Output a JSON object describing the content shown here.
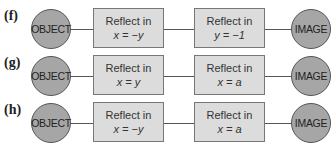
{
  "rows": [
    {
      "label": "(f)",
      "start": "OBJECT",
      "steps": [
        {
          "title": "Reflect in",
          "eq": "x = −y"
        },
        {
          "title": "Reflect in",
          "eq": "y = −1"
        }
      ],
      "end": "IMAGE"
    },
    {
      "label": "(g)",
      "start": "OBJECT",
      "steps": [
        {
          "title": "Reflect in",
          "eq": "x = y"
        },
        {
          "title": "Reflect in",
          "eq": "x = a"
        }
      ],
      "end": "IMAGE"
    },
    {
      "label": "(h)",
      "start": "OBJECT",
      "steps": [
        {
          "title": "Reflect in",
          "eq": "x = −y"
        },
        {
          "title": "Reflect in",
          "eq": "x = a"
        }
      ],
      "end": "IMAGE"
    }
  ],
  "colors": {
    "circle_fill": "#a6a6a6",
    "box_fill": "#dcdcdc",
    "line": "#555555"
  }
}
